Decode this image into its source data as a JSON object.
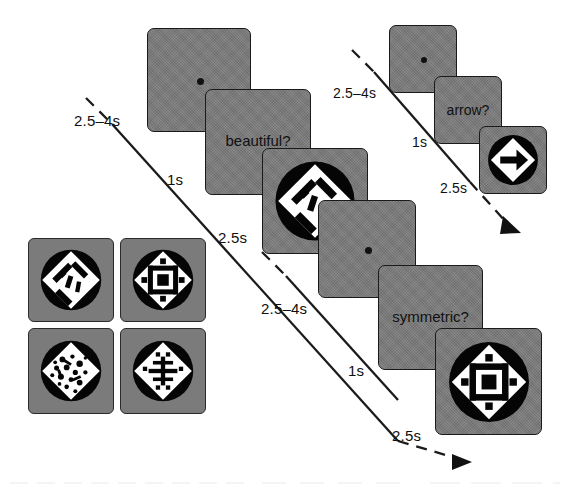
{
  "figure": {
    "type": "experimental-paradigm-timeline",
    "background_color": "#ffffff",
    "card_color": "#7b7b7b",
    "ink_color": "#111111",
    "stimulus_disc_color": "#000000",
    "stimulus_shape_color": "#ffffff"
  },
  "stimulus_grid": {
    "name": "example-stimuli-grid",
    "rows": 2,
    "cols": 2,
    "items": [
      {
        "id": "stimulus-top-left",
        "pattern": "asymmetric-diamond-slashes"
      },
      {
        "id": "stimulus-top-right",
        "pattern": "symmetric-diamond-nested-square"
      },
      {
        "id": "stimulus-bottom-left",
        "pattern": "asymmetric-diamond-speckled"
      },
      {
        "id": "stimulus-bottom-right",
        "pattern": "symmetric-diamond-crosshatch"
      }
    ]
  },
  "trials": [
    {
      "id": "trial-beautiful",
      "task_label": "beautiful?",
      "stimulus_pattern": "asymmetric-diamond-slashes",
      "steps": [
        {
          "name": "fixation",
          "duration": "2.5–4s",
          "content": "fixation-dot"
        },
        {
          "name": "cue",
          "duration": "1s",
          "content": "beautiful?"
        },
        {
          "name": "stimulus",
          "duration": "2.5s",
          "content": "pattern-stimulus"
        }
      ],
      "durations": [
        "2.5–4s",
        "1s",
        "2.5s"
      ]
    },
    {
      "id": "trial-arrow",
      "task_label": "arrow?",
      "stimulus_pattern": "arrow-diamond-right",
      "steps": [
        {
          "name": "fixation",
          "duration": "2.5–4s",
          "content": "fixation-dot"
        },
        {
          "name": "cue",
          "duration": "1s",
          "content": "arrow?"
        },
        {
          "name": "stimulus",
          "duration": "2.5s",
          "content": "arrow-stimulus"
        }
      ],
      "durations": [
        "2.5–4s",
        "1s",
        "2.5s"
      ]
    },
    {
      "id": "trial-symmetric",
      "task_label": "symmetric?",
      "stimulus_pattern": "symmetric-diamond-nested-square",
      "steps": [
        {
          "name": "fixation",
          "duration": "2.5–4s",
          "content": "fixation-dot"
        },
        {
          "name": "cue",
          "duration": "1s",
          "content": "symmetric?"
        },
        {
          "name": "stimulus",
          "duration": "2.5s",
          "content": "pattern-stimulus"
        }
      ],
      "durations": [
        "2.5–4s",
        "1s",
        "2.5s"
      ]
    }
  ],
  "time_axes": [
    {
      "id": "timeline-arrow-trial",
      "direction": "down-right",
      "style": "solid-with-dashed-ends",
      "arrowhead": true
    },
    {
      "id": "timeline-symmetric-trial",
      "direction": "down-right",
      "style": "solid-with-dashed-ends",
      "arrowhead": true
    }
  ]
}
